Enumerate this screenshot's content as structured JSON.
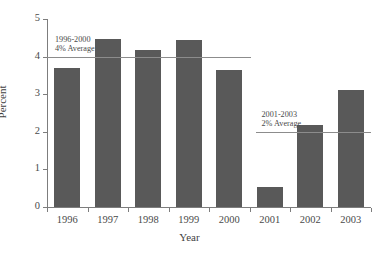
{
  "chart_data": {
    "type": "bar",
    "title": "",
    "xlabel": "Year",
    "ylabel": "Percent",
    "categories": [
      "1996",
      "1997",
      "1998",
      "1999",
      "2000",
      "2001",
      "2002",
      "2003"
    ],
    "values": [
      3.7,
      4.48,
      4.17,
      4.43,
      3.65,
      0.52,
      2.19,
      3.11
    ],
    "ylim": [
      0,
      5
    ],
    "yticks": [
      "0",
      "1",
      "2",
      "3",
      "4",
      "5"
    ],
    "ytick_values": [
      0,
      1,
      2,
      3,
      4,
      5
    ],
    "grid": false,
    "legend": "none",
    "bar_color": "#595959",
    "axis_color": "#7d7d7d",
    "reference_lines": [
      {
        "name": "1996-2000 average",
        "value": 4,
        "label_line1": "1996-2000",
        "label_line2": "4% Average",
        "span_categories": [
          "1996",
          "2000"
        ],
        "color": "#8c8c8c"
      },
      {
        "name": "2001-2003 average",
        "value": 2,
        "label_line1": "2001-2003",
        "label_line2": "2% Average",
        "span_categories": [
          "2001",
          "2003"
        ],
        "color": "#8c8c8c"
      }
    ]
  },
  "axes": {
    "y_title": "Percent",
    "x_title": "Year"
  }
}
